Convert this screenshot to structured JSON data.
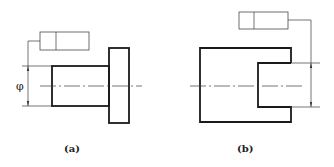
{
  "figures": [
    {
      "id": "a",
      "label": "(a)",
      "dimension_symbol": "φ",
      "description": "shaft with flange; geometric tolerance frame leader to diameter dimension"
    },
    {
      "id": "b",
      "label": "(b)",
      "description": "block with slot; geometric tolerance frame leader to slot width dimension"
    }
  ],
  "colors": {
    "outline": "#1a1a1a",
    "thin_line": "#3a3a3a",
    "background": "#ffffff"
  }
}
